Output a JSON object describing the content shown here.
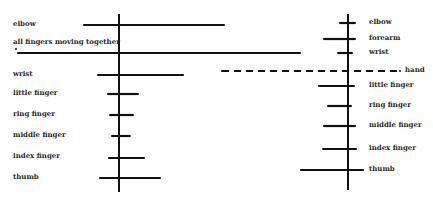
{
  "chart_data": [
    {
      "type": "errorbar",
      "title": "",
      "panel": "left",
      "axis_x": 119,
      "axis_y_range": [
        14,
        192
      ],
      "categories": [
        "elbow",
        "all fingers moving together",
        "wrist",
        "little finger",
        "ring finger",
        "middle finger",
        "index finger",
        "thumb"
      ],
      "series": [
        {
          "name": "elbow",
          "y": 25,
          "x_start": 84,
          "x_end": 224
        },
        {
          "name": "all fingers moving together",
          "y": 53,
          "x_start": 18,
          "x_end": 300
        },
        {
          "name": "wrist",
          "y": 75,
          "x_start": 98,
          "x_end": 183
        },
        {
          "name": "little finger",
          "y": 94,
          "x_start": 108,
          "x_end": 138
        },
        {
          "name": "ring finger",
          "y": 115,
          "x_start": 110,
          "x_end": 133
        },
        {
          "name": "middle finger",
          "y": 136,
          "x_start": 112,
          "x_end": 130
        },
        {
          "name": "index finger",
          "y": 158,
          "x_start": 109,
          "x_end": 144
        },
        {
          "name": "thumb",
          "y": 178,
          "x_start": 100,
          "x_end": 160
        }
      ],
      "grid": false,
      "legend": "labels at left"
    },
    {
      "type": "errorbar",
      "title": "",
      "panel": "right",
      "axis_x": 348,
      "axis_y_range": [
        14,
        190
      ],
      "categories": [
        "elbow",
        "forearm",
        "wrist",
        "hand",
        "little finger",
        "ring finger",
        "middle finger",
        "index finger",
        "thumb"
      ],
      "series": [
        {
          "name": "elbow",
          "y": 23,
          "x_start": 340,
          "x_end": 355
        },
        {
          "name": "forearm",
          "y": 39,
          "x_start": 324,
          "x_end": 355
        },
        {
          "name": "wrist",
          "y": 53,
          "x_start": 338,
          "x_end": 352
        },
        {
          "name": "hand",
          "y": 71,
          "x_start": 222,
          "x_end": 400,
          "style": "dashed"
        },
        {
          "name": "little finger",
          "y": 86,
          "x_start": 319,
          "x_end": 354
        },
        {
          "name": "ring finger",
          "y": 106,
          "x_start": 328,
          "x_end": 351
        },
        {
          "name": "middle finger",
          "y": 126,
          "x_start": 324,
          "x_end": 355
        },
        {
          "name": "index finger",
          "y": 149,
          "x_start": 323,
          "x_end": 356
        },
        {
          "name": "thumb",
          "y": 170,
          "x_start": 301,
          "x_end": 363
        }
      ],
      "grid": false,
      "legend": "labels at right"
    }
  ],
  "left_labels": {
    "elbow": "elbow",
    "all_fingers": "all fingers moving together",
    "wrist": "wrist",
    "little": "little finger",
    "ring": "ring finger",
    "middle": "middle finger",
    "index": "index finger",
    "thumb": "thumb"
  },
  "right_labels": {
    "elbow": "elbow",
    "forearm": "forearm",
    "wrist": "wrist",
    "hand": "hand",
    "little": "little finger",
    "ring": "ring finger",
    "middle": "middle finger",
    "index": "index finger",
    "thumb": "thumb"
  },
  "colors": {
    "line": "#111111",
    "text": "#2a2a2a",
    "background": "#ffffff"
  }
}
